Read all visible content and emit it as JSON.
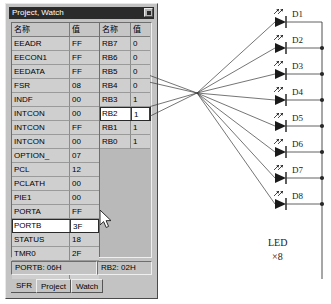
{
  "window": {
    "title": "Project, Watch",
    "close_icon": "close-icon"
  },
  "sfr_table": {
    "headers": [
      "名称",
      "值"
    ],
    "rows": [
      {
        "name": "EEADR",
        "value": "FF"
      },
      {
        "name": "EECON1",
        "value": "FF"
      },
      {
        "name": "EEDATA",
        "value": "FF"
      },
      {
        "name": "FSR",
        "value": "08"
      },
      {
        "name": "INDF",
        "value": "00"
      },
      {
        "name": "INTCON",
        "value": "00"
      },
      {
        "name": "INTCON",
        "value": "FF"
      },
      {
        "name": "INTCON",
        "value": "00"
      },
      {
        "name": "OPTION_",
        "value": "07"
      },
      {
        "name": "PCL",
        "value": "12"
      },
      {
        "name": "PCLATH",
        "value": "00"
      },
      {
        "name": "PIE1",
        "value": "00"
      },
      {
        "name": "PORTA",
        "value": "FF"
      },
      {
        "name": "PORTB",
        "value": "3F",
        "selected": true
      },
      {
        "name": "STATUS",
        "value": "18"
      },
      {
        "name": "TMR0",
        "value": "2F"
      },
      {
        "name": "TRISA",
        "value": "FF"
      },
      {
        "name": "TRISB",
        "value": "00"
      }
    ]
  },
  "bit_table": {
    "headers": [
      "名称",
      "值"
    ],
    "rows": [
      {
        "name": "RB7",
        "value": "0"
      },
      {
        "name": "RB6",
        "value": "0"
      },
      {
        "name": "RB5",
        "value": "0"
      },
      {
        "name": "RB4",
        "value": "0"
      },
      {
        "name": "RB3",
        "value": "1"
      },
      {
        "name": "RB2",
        "value": "1",
        "selected": true
      },
      {
        "name": "RB1",
        "value": "1"
      },
      {
        "name": "RB0",
        "value": "1"
      }
    ]
  },
  "statusbar": {
    "left": "PORTB: 06H",
    "right": "RB2: 02H"
  },
  "tabs": [
    {
      "label": "SFR",
      "active": true
    },
    {
      "label": "Project",
      "active": false
    },
    {
      "label": "Watch",
      "active": false
    }
  ],
  "circuit": {
    "leds": [
      "D1",
      "D2",
      "D3",
      "D4",
      "D5",
      "D6",
      "D7",
      "D8"
    ],
    "caption_line1": "LED",
    "caption_line2": "×8"
  }
}
